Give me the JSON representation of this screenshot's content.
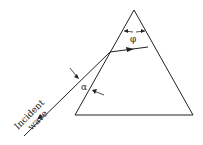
{
  "diagram": {
    "labels": {
      "incident_line1": "Incident",
      "incident_line2": "wave",
      "alpha": "α",
      "phi": "φ"
    },
    "colors": {
      "stroke": "#222222",
      "background": "#ffffff"
    }
  }
}
